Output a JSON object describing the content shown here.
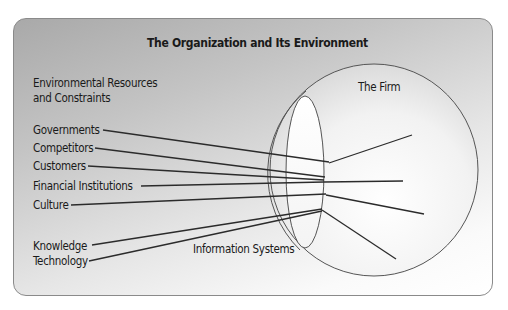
{
  "diagram": {
    "title": "The Organization and Its Environment",
    "environment_heading_line1": "Environmental Resources",
    "environment_heading_line2": "and Constraints",
    "firm_label": "The Firm",
    "info_systems_label": "Information Systems",
    "environment_factors": [
      {
        "label": "Governments"
      },
      {
        "label": "Competitors"
      },
      {
        "label": "Customers"
      },
      {
        "label": "Financial Institutions"
      },
      {
        "label": "Culture"
      },
      {
        "label": "Knowledge"
      },
      {
        "label": "Technology"
      }
    ],
    "colors": {
      "line": "#2b2b2b",
      "card_border": "#8a8a8a",
      "gradient_dark": "#a9a9a9",
      "gradient_light": "#ffffff",
      "text": "#1a1a1a"
    }
  }
}
